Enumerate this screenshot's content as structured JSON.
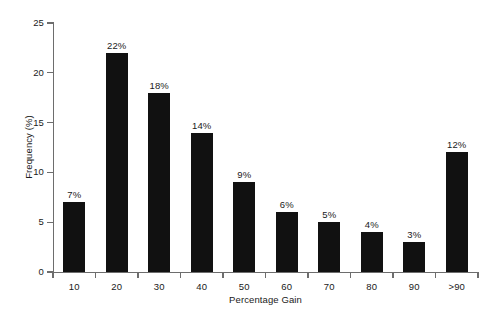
{
  "chart_data": {
    "type": "bar",
    "title": "",
    "subtitle": "",
    "xlabel": "Percentage Gain",
    "ylabel": "Frequency (%)",
    "categories": [
      "10",
      "20",
      "30",
      "40",
      "50",
      "60",
      "70",
      "80",
      "90",
      ">90"
    ],
    "values": [
      7,
      22,
      18,
      14,
      9,
      6,
      5,
      4,
      3,
      12
    ],
    "data_labels": [
      "7%",
      "22%",
      "18%",
      "14%",
      "9%",
      "6%",
      "5%",
      "4%",
      "3%",
      "12%"
    ],
    "ylim": [
      0,
      25
    ],
    "y_ticks": [
      0,
      5,
      10,
      15,
      20,
      25
    ],
    "y_tick_labels": [
      "0",
      "5",
      "10",
      "15",
      "20",
      "25"
    ],
    "grid": false,
    "legend": null,
    "legend_position": "none",
    "bar_color": "#111111",
    "axis_color": "#6d6d6d",
    "text_color": "#1a1a1a",
    "background_color": "#ffffff",
    "x_tick_style": "between-bars",
    "annotations": []
  }
}
